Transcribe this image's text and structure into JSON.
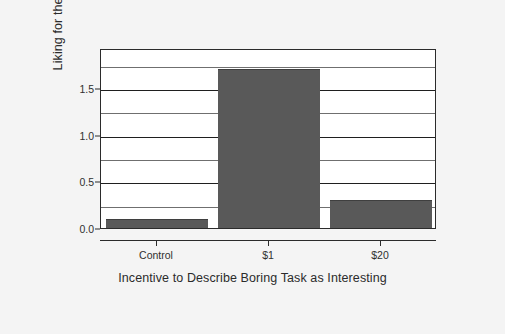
{
  "chart_data": {
    "type": "bar",
    "title": "",
    "categories": [
      "Control",
      "$1",
      "$20"
    ],
    "values": [
      0.1,
      1.7,
      0.3
    ],
    "xlabel": "Incentive to Describe Boring Task as Interesting",
    "ylabel": "Liking for the Tasks",
    "ylim": [
      0.0,
      1.93
    ],
    "ytick_labels": [
      "0.0",
      "0.5",
      "1.0",
      "1.5"
    ],
    "ytick_values": [
      0.0,
      0.5,
      1.0,
      1.5
    ],
    "gridlines_major": [
      0.5,
      1.0,
      1.5
    ],
    "gridlines_minor": [
      0.25,
      0.75,
      1.25,
      1.75
    ],
    "grid": true,
    "legend": "none",
    "bar_color": "#595959",
    "plot_background": "#ffffff",
    "figure_background": "#f4f4f4",
    "axis_color": "#2b2b2b"
  },
  "axis": {
    "y_title": "Liking for the Tasks",
    "x_title": "Incentive to Describe Boring Task as Interesting"
  },
  "ticks": {
    "y": [
      {
        "label": "0.0",
        "value": 0.0
      },
      {
        "label": "0.5",
        "value": 0.5
      },
      {
        "label": "1.0",
        "value": 1.0
      },
      {
        "label": "1.5",
        "value": 1.5
      }
    ],
    "x": [
      {
        "label": "Control"
      },
      {
        "label": "$1"
      },
      {
        "label": "$20"
      }
    ]
  },
  "bars": [
    {
      "category": "Control",
      "value": 0.1
    },
    {
      "category": "$1",
      "value": 1.7
    },
    {
      "category": "$20",
      "value": 0.3
    }
  ]
}
